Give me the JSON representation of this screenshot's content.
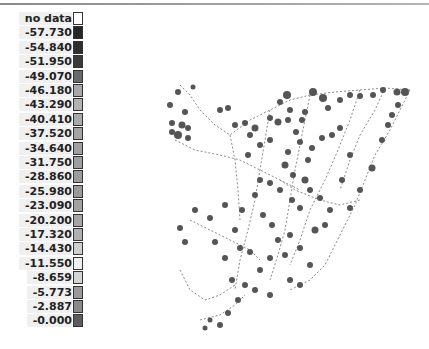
{
  "legend": {
    "items": [
      {
        "label": "no data",
        "color": "#ffffff"
      },
      {
        "label": "-57.730",
        "color": "#262626"
      },
      {
        "label": "-54.840",
        "color": "#2e2e2e"
      },
      {
        "label": "-51.950",
        "color": "#3a3a3a"
      },
      {
        "label": "-49.070",
        "color": "#6a6a6a"
      },
      {
        "label": "-46.180",
        "color": "#a8a8a8"
      },
      {
        "label": "-43.290",
        "color": "#b2b2b2"
      },
      {
        "label": "-40.410",
        "color": "#aaaaaa"
      },
      {
        "label": "-37.520",
        "color": "#a4a4a4"
      },
      {
        "label": "-34.640",
        "color": "#a0a0a0"
      },
      {
        "label": "-31.750",
        "color": "#9e9e9e"
      },
      {
        "label": "-28.860",
        "color": "#9c9c9c"
      },
      {
        "label": "-25.980",
        "color": "#9a9a9a"
      },
      {
        "label": "-23.090",
        "color": "#a2a2a2"
      },
      {
        "label": "-20.200",
        "color": "#a6a6a6"
      },
      {
        "label": "-17.320",
        "color": "#b0b0b0"
      },
      {
        "label": "-14.430",
        "color": "#cfcfcf"
      },
      {
        "label": "-11.550",
        "color": "#efefef"
      },
      {
        "label": "-8.659",
        "color": "#d4d4d4"
      },
      {
        "label": "-5.773",
        "color": "#9a9a9a"
      },
      {
        "label": "-2.887",
        "color": "#8a8a8a"
      },
      {
        "label": "-0.000",
        "color": "#5c5c5c"
      }
    ]
  },
  "map": {
    "dot_color": "#555555",
    "line_color": "#888888"
  }
}
